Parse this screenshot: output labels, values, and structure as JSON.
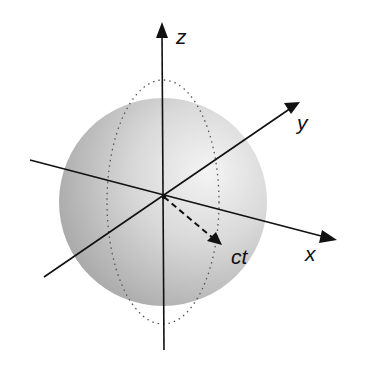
{
  "diagram": {
    "sphere": {
      "cx": 163,
      "cy": 202,
      "r": 104,
      "fill_light": "#f2f2f2",
      "fill_dark": "#a8a8a8"
    },
    "axes": {
      "z": {
        "label": "z"
      },
      "y": {
        "label": "y"
      },
      "x": {
        "label": "x"
      }
    },
    "radius_vector": {
      "label": "ct"
    },
    "colors": {
      "line": "#111111",
      "dotted": "#555555"
    }
  }
}
